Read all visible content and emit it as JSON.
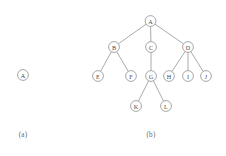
{
  "figure": {
    "type": "tree-diagram",
    "background_color": "#ffffff",
    "stroke_color": "#8a8a8a",
    "text_color": "#4a4a4a",
    "caption_color": "#6b6b6b",
    "node_radius": 5.4
  },
  "panels": [
    {
      "id": "a",
      "caption": "(a)",
      "caption_pos": {
        "x": 23,
        "y": 135
      },
      "nodes": [
        {
          "id": "A",
          "label": "A",
          "x": 23,
          "y": 75
        }
      ],
      "edges": []
    },
    {
      "id": "b",
      "caption": "(b)",
      "caption_pos": {
        "x": 151,
        "y": 135
      },
      "nodes": [
        {
          "id": "A",
          "label": "A",
          "x": 150.5,
          "y": 21
        },
        {
          "id": "B",
          "label": "B",
          "x": 114,
          "y": 47
        },
        {
          "id": "C",
          "label": "C",
          "x": 151,
          "y": 47
        },
        {
          "id": "D",
          "label": "D",
          "x": 188,
          "y": 47
        },
        {
          "id": "E",
          "label": "E",
          "x": 98,
          "y": 76
        },
        {
          "id": "F",
          "label": "F",
          "x": 131,
          "y": 76
        },
        {
          "id": "G",
          "label": "G",
          "x": 151,
          "y": 76
        },
        {
          "id": "H",
          "label": "H",
          "x": 169,
          "y": 76
        },
        {
          "id": "I",
          "label": "I",
          "x": 188,
          "y": 76
        },
        {
          "id": "J",
          "label": "J",
          "x": 206,
          "y": 76
        },
        {
          "id": "K",
          "label": "K",
          "x": 136,
          "y": 106
        },
        {
          "id": "L",
          "label": "L",
          "x": 166,
          "y": 106
        }
      ],
      "edges": [
        {
          "from": "A",
          "to": "B"
        },
        {
          "from": "A",
          "to": "C"
        },
        {
          "from": "A",
          "to": "D"
        },
        {
          "from": "B",
          "to": "E"
        },
        {
          "from": "B",
          "to": "F"
        },
        {
          "from": "C",
          "to": "G"
        },
        {
          "from": "D",
          "to": "H"
        },
        {
          "from": "D",
          "to": "I"
        },
        {
          "from": "D",
          "to": "J"
        },
        {
          "from": "G",
          "to": "K"
        },
        {
          "from": "G",
          "to": "L"
        }
      ]
    }
  ]
}
